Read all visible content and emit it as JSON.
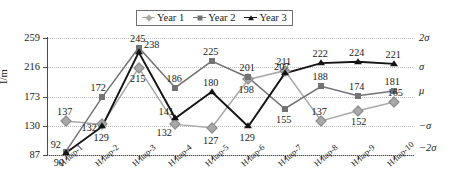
{
  "legend": {
    "position": "top-center",
    "entries": [
      {
        "label": "Year 1",
        "marker": "diamond-icon",
        "color": "#a9a9a9"
      },
      {
        "label": "Year 2",
        "marker": "square-icon",
        "color": "#737373"
      },
      {
        "label": "Year 3",
        "marker": "triangle-icon",
        "color": "#141414"
      }
    ]
  },
  "axes": {
    "ylabel": "I/m",
    "yticks": [
      "259",
      "216",
      "173",
      "130",
      "87"
    ],
    "ylim": [
      87,
      259
    ],
    "xlabel": "",
    "grid": true
  },
  "sigma_labels": [
    {
      "text": "2σ",
      "value": 259
    },
    {
      "text": "σ",
      "value": 216
    },
    {
      "text": "μ",
      "value": 181
    },
    {
      "text": "−σ",
      "value": 130
    },
    {
      "text": "−2σ",
      "value": 98
    }
  ],
  "chart_data": {
    "type": "line",
    "title": "",
    "xlabel": "",
    "ylabel": "I/m",
    "ylim": [
      87,
      259
    ],
    "yticks": [
      87,
      130,
      173,
      216,
      259
    ],
    "grid": true,
    "legend_position": "top-center",
    "categories": [
      "H/hap-1",
      "H/hap-2",
      "H/hap-3",
      "H/hap-4",
      "H/hap-5",
      "H/hap-6",
      "H/hap-7",
      "H/hap-8",
      "H/hap-9",
      "H/hap-10"
    ],
    "series": [
      {
        "name": "Year 1",
        "color": "#a9a9a9",
        "marker": "diamond",
        "values": [
          137,
          132,
          215,
          132,
          127,
          198,
          211,
          137,
          152,
          165
        ]
      },
      {
        "name": "Year 2",
        "color": "#737373",
        "marker": "square",
        "values": [
          92,
          172,
          245,
          186,
          225,
          201,
          155,
          188,
          174,
          181
        ]
      },
      {
        "name": "Year 3",
        "color": "#141414",
        "marker": "triangle",
        "values": [
          90,
          129,
          238,
          141,
          180,
          129,
          207,
          222,
          224,
          221
        ]
      }
    ],
    "annotations": [
      {
        "text": "137",
        "series": "Year 1",
        "index": 0
      },
      {
        "text": "132",
        "series": "Year 1",
        "index": 1
      },
      {
        "text": "215",
        "series": "Year 1",
        "index": 2
      },
      {
        "text": "132",
        "series": "Year 1",
        "index": 3
      },
      {
        "text": "127",
        "series": "Year 1",
        "index": 4
      },
      {
        "text": "198",
        "series": "Year 1",
        "index": 5
      },
      {
        "text": "211",
        "series": "Year 1",
        "index": 6
      },
      {
        "text": "137",
        "series": "Year 1",
        "index": 7
      },
      {
        "text": "152",
        "series": "Year 1",
        "index": 8
      },
      {
        "text": "165",
        "series": "Year 1",
        "index": 9
      },
      {
        "text": "92",
        "series": "Year 2",
        "index": 0
      },
      {
        "text": "172",
        "series": "Year 2",
        "index": 1
      },
      {
        "text": "245",
        "series": "Year 2",
        "index": 2
      },
      {
        "text": "186",
        "series": "Year 2",
        "index": 3
      },
      {
        "text": "225",
        "series": "Year 2",
        "index": 4
      },
      {
        "text": "201",
        "series": "Year 2",
        "index": 5
      },
      {
        "text": "155",
        "series": "Year 2",
        "index": 6
      },
      {
        "text": "188",
        "series": "Year 2",
        "index": 7
      },
      {
        "text": "174",
        "series": "Year 2",
        "index": 8
      },
      {
        "text": "181",
        "series": "Year 2",
        "index": 9
      },
      {
        "text": "90",
        "series": "Year 3",
        "index": 0
      },
      {
        "text": "129",
        "series": "Year 3",
        "index": 1
      },
      {
        "text": "238",
        "series": "Year 3",
        "index": 2
      },
      {
        "text": "141",
        "series": "Year 3",
        "index": 3
      },
      {
        "text": "180",
        "series": "Year 3",
        "index": 4
      },
      {
        "text": "129",
        "series": "Year 3",
        "index": 5
      },
      {
        "text": "207",
        "series": "Year 3",
        "index": 6
      },
      {
        "text": "222",
        "series": "Year 3",
        "index": 7
      },
      {
        "text": "224",
        "series": "Year 3",
        "index": 8
      },
      {
        "text": "221",
        "series": "Year 3",
        "index": 9
      }
    ]
  }
}
